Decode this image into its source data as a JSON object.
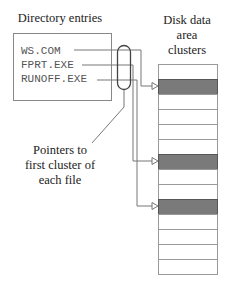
{
  "directory": {
    "title": "Directory entries",
    "entries": [
      {
        "name": "WS.COM",
        "target_cluster": 1
      },
      {
        "name": "FPRT.EXE",
        "target_cluster": 6
      },
      {
        "name": "RUNOFF.EXE",
        "target_cluster": 9
      }
    ]
  },
  "disk": {
    "title_lines": [
      "Disk data",
      "area",
      "clusters"
    ],
    "cluster_count": 14,
    "shaded_clusters": [
      1,
      6,
      9
    ]
  },
  "callout": {
    "lines": [
      "Pointers to",
      "first cluster of",
      "each file"
    ]
  },
  "colors": {
    "line": "#777777",
    "shaded": "#7a7a7a",
    "text": "#222222",
    "mono_text": "#555555"
  }
}
